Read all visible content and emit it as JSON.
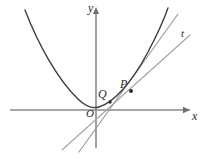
{
  "figure": {
    "kind": "math-diagram",
    "background_color": "#ffffff"
  },
  "axes": {
    "x_axis_label": "x",
    "y_axis_label": "y",
    "origin_label": "O",
    "axis_color": "#8a8a8a",
    "x_axis": {
      "x1": 10,
      "y1": 110,
      "x2": 190,
      "y2": 110
    },
    "y_axis": {
      "x1": 96,
      "y1": 148,
      "x2": 96,
      "y2": 8
    }
  },
  "points": [
    {
      "label": "Q",
      "x": 110,
      "y": 102,
      "marker": true
    },
    {
      "label": "P",
      "x": 131,
      "y": 91,
      "marker": true
    }
  ],
  "curves": [
    {
      "name": "parabola",
      "label": "",
      "color": "#3a3a3a",
      "path": "M 25,10 C 38,44 58,80 78,99 C 86,107 92,109 99,107 C 112,103 130,86 148,52 C 156,37 163,22 168,8"
    }
  ],
  "lines": [
    {
      "name": "tangent-at-P",
      "label": "t",
      "color": "#9a9a9a",
      "x1": 79,
      "y1": 152,
      "x2": 178,
      "y2": 14
    },
    {
      "name": "secant-through-Q-and-P",
      "label": "",
      "color": "#a3a3a3",
      "x1": 62,
      "y1": 150,
      "x2": 190,
      "y2": 35
    }
  ],
  "labels": {
    "y": "y",
    "x": "x",
    "origin": "O",
    "point_q": "Q",
    "point_p": "P",
    "tangent": "t"
  }
}
